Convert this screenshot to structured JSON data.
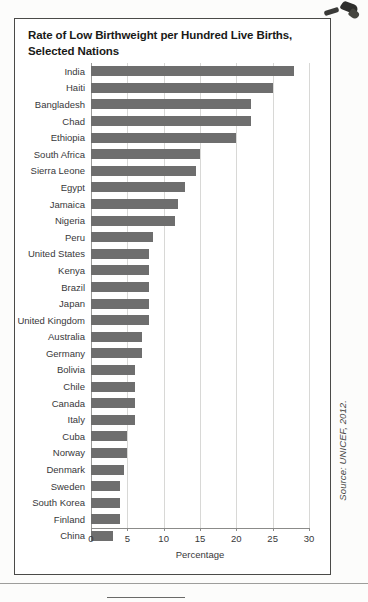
{
  "figure": {
    "title": "Rate of Low Birthweight per Hundred Live Births, Selected Nations",
    "source": "Source: UNICEF, 2012."
  },
  "chart_data": {
    "type": "bar",
    "orientation": "horizontal",
    "title": "Rate of Low Birthweight per Hundred Live Births, Selected Nations",
    "xlabel": "Percentage",
    "ylabel": "",
    "xlim": [
      0,
      30
    ],
    "xticks": [
      0,
      5,
      10,
      15,
      20,
      25,
      30
    ],
    "grid": true,
    "grid_axis": "x",
    "legend": "none",
    "bar_color": "#6e6e6e",
    "categories": [
      "India",
      "Haiti",
      "Bangladesh",
      "Chad",
      "Ethiopia",
      "South Africa",
      "Sierra Leone",
      "Egypt",
      "Jamaica",
      "Nigeria",
      "Peru",
      "United States",
      "Kenya",
      "Brazil",
      "Japan",
      "United Kingdom",
      "Australia",
      "Germany",
      "Bolivia",
      "Chile",
      "Canada",
      "Italy",
      "Cuba",
      "Norway",
      "Denmark",
      "Sweden",
      "South Korea",
      "Finland",
      "China"
    ],
    "values": [
      28,
      25,
      22,
      22,
      20,
      15,
      14.5,
      13,
      12,
      11.5,
      8.5,
      8,
      8,
      8,
      8,
      8,
      7,
      7,
      6,
      6,
      6,
      6,
      5,
      5,
      4.5,
      4,
      4,
      4,
      3
    ]
  }
}
